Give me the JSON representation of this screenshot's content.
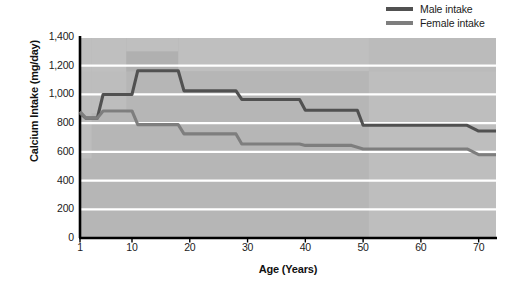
{
  "chart_data": {
    "type": "line",
    "title": "",
    "xlabel": "Age (Years)",
    "ylabel": "Calcium Intake (mg/day)",
    "xlim": [
      1,
      73
    ],
    "ylim": [
      0,
      1400
    ],
    "grid": true,
    "legend_position": "top-right",
    "xticks": [
      1,
      10,
      20,
      30,
      40,
      50,
      60,
      70
    ],
    "xtick_labels": [
      "1",
      "10",
      "20",
      "30",
      "40",
      "50",
      "60",
      "70"
    ],
    "yticks": [
      0,
      200,
      400,
      600,
      800,
      1000,
      1200,
      1400
    ],
    "ytick_labels": [
      "0",
      "200",
      "400",
      "600",
      "800",
      "1,000",
      "1,200",
      "1,400"
    ],
    "series": [
      {
        "name": "Male intake",
        "color": "#515151",
        "step": true,
        "points": [
          {
            "x": 1,
            "y": 870
          },
          {
            "x": 2,
            "y": 835
          },
          {
            "x": 4,
            "y": 835
          },
          {
            "x": 5,
            "y": 1000
          },
          {
            "x": 10,
            "y": 1000
          },
          {
            "x": 11,
            "y": 1165
          },
          {
            "x": 18,
            "y": 1165
          },
          {
            "x": 19,
            "y": 1025
          },
          {
            "x": 28,
            "y": 1025
          },
          {
            "x": 29,
            "y": 965
          },
          {
            "x": 39,
            "y": 965
          },
          {
            "x": 40,
            "y": 890
          },
          {
            "x": 49,
            "y": 890
          },
          {
            "x": 50,
            "y": 785
          },
          {
            "x": 68,
            "y": 785
          },
          {
            "x": 70,
            "y": 745
          },
          {
            "x": 73,
            "y": 745
          }
        ]
      },
      {
        "name": "Female intake",
        "color": "#7e7e7e",
        "step": true,
        "points": [
          {
            "x": 1,
            "y": 880
          },
          {
            "x": 2,
            "y": 835
          },
          {
            "x": 4,
            "y": 835
          },
          {
            "x": 5,
            "y": 885
          },
          {
            "x": 10,
            "y": 885
          },
          {
            "x": 11,
            "y": 790
          },
          {
            "x": 18,
            "y": 790
          },
          {
            "x": 19,
            "y": 725
          },
          {
            "x": 28,
            "y": 725
          },
          {
            "x": 29,
            "y": 655
          },
          {
            "x": 39,
            "y": 655
          },
          {
            "x": 40,
            "y": 645
          },
          {
            "x": 48,
            "y": 645
          },
          {
            "x": 50,
            "y": 620
          },
          {
            "x": 68,
            "y": 620
          },
          {
            "x": 70,
            "y": 580
          },
          {
            "x": 73,
            "y": 580
          }
        ]
      }
    ],
    "shaded_bands": [
      {
        "name": "recommended-band-low",
        "x_from": 1,
        "x_to": 3,
        "y_from": 555,
        "y_to": 1400
      },
      {
        "name": "recommended-band-child",
        "x_from": 3,
        "x_to": 9,
        "y_from": 870,
        "y_to": 1400
      },
      {
        "name": "recommended-band-teen",
        "x_from": 9,
        "x_to": 18,
        "y_from": 1300,
        "y_to": 1400
      },
      {
        "name": "recommended-band-adult",
        "x_from": 18,
        "x_to": 51,
        "y_from": 1160,
        "y_to": 1400
      },
      {
        "name": "recommended-band-senior",
        "x_from": 51,
        "x_to": 73,
        "y_from": 1400,
        "y_to": 1400
      }
    ]
  },
  "legend": {
    "items": [
      {
        "label": "Male intake",
        "color": "#515151",
        "name": "legend-male"
      },
      {
        "label": "Female intake",
        "color": "#7e7e7e",
        "name": "legend-female"
      }
    ]
  },
  "axes": {
    "y_title": "Calcium Intake (mg/day)",
    "x_title": "Age (Years)"
  },
  "colors": {
    "male_line": "#515151",
    "female_line": "#7e7e7e",
    "plot_background": "#b0b0b0",
    "band_light": "#c4c4c4",
    "band_lighter": "#bdbdbd",
    "gridline": "#ffffff",
    "axis": "#000000",
    "text": "#1b1b1b"
  }
}
